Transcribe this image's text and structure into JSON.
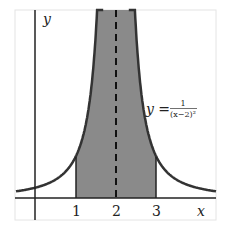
{
  "chart_data": {
    "type": "area",
    "title": "",
    "function": "y = 1/(x-2)^2",
    "curve_label": {
      "lhs": "y =",
      "numerator": "1",
      "denominator": "(x−2)²"
    },
    "xlabel": "x",
    "ylabel": "y",
    "x_ticks": [
      "1",
      "2",
      "3"
    ],
    "xlim": [
      -0.5,
      4.5
    ],
    "ylim": [
      -0.5,
      4.5
    ],
    "shaded_region": {
      "from": 1,
      "to": 3
    },
    "asymptote": {
      "x": 2,
      "style": "dashed"
    },
    "grid": false,
    "colors": {
      "curve": "#333333",
      "shade": "#888888",
      "axis": "#222222"
    }
  }
}
